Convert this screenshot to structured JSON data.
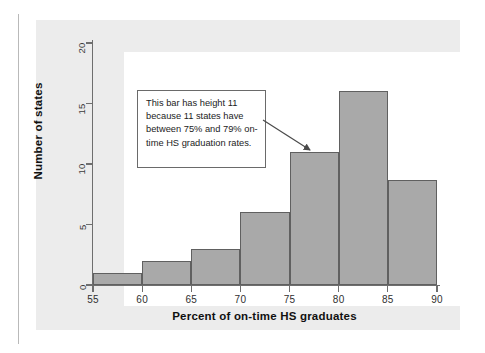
{
  "figure": {
    "annotation": {
      "text": "This bar has height 11 because 11 states have between 75% and 79% on-time HS graduation rates.",
      "points_to_bin": "75-80"
    }
  },
  "chart_data": {
    "type": "bar",
    "title": "",
    "subtitle": "",
    "xlabel": "Percent of on-time HS graduates",
    "ylabel": "Number of states",
    "categories": [
      "55-60",
      "60-65",
      "65-70",
      "70-75",
      "75-80",
      "80-85",
      "85-90"
    ],
    "bin_edges": [
      55,
      60,
      65,
      70,
      75,
      80,
      85,
      90
    ],
    "values": [
      1,
      2,
      3,
      6,
      11,
      16,
      8.7
    ],
    "xlim": [
      55,
      90
    ],
    "ylim": [
      0,
      20
    ],
    "xticks": [
      55,
      60,
      65,
      70,
      75,
      80,
      85,
      90
    ],
    "xtick_labels": [
      "55",
      "60",
      "65",
      "70",
      "75",
      "80",
      "85",
      "90"
    ],
    "yticks": [
      0,
      5,
      10,
      15,
      20
    ],
    "ytick_labels": [
      "0",
      "5",
      "10",
      "15",
      "20"
    ],
    "grid": false,
    "legend": null,
    "bar_fill_color": "#a9a9a9",
    "bar_edge_color": "#606060",
    "axis_color": "#6e6e6e",
    "panel_color": "#ececec",
    "plot_background": "#ffffff",
    "annotations": [
      {
        "text": "This bar has height 11 because 11 states have between 75% and 79% on-time HS graduation rates.",
        "target_bin": "75-80",
        "target_value": 11
      }
    ]
  }
}
